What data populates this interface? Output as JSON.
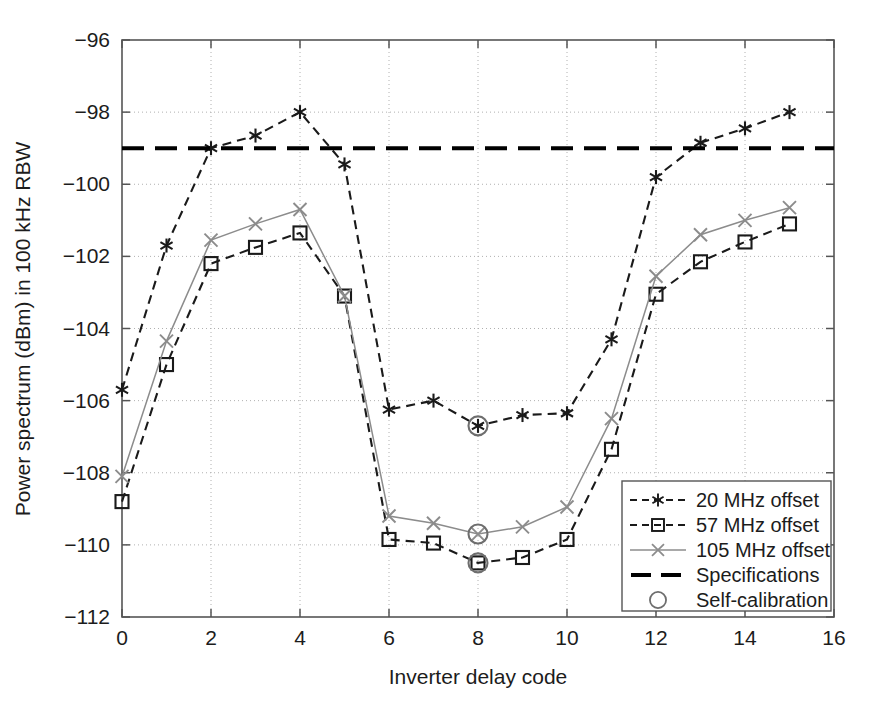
{
  "chart_data": {
    "type": "line",
    "title": "",
    "xlabel": "Inverter delay code",
    "ylabel": "Power spectrum (dBm) in 100 kHz RBW",
    "xlim": [
      0,
      16
    ],
    "ylim": [
      -112,
      -96
    ],
    "xticks": [
      0,
      2,
      4,
      6,
      8,
      10,
      12,
      14,
      16
    ],
    "yticks": [
      -112,
      -110,
      -108,
      -106,
      -104,
      -102,
      -100,
      -98,
      -96
    ],
    "xtick_labels": [
      "0",
      "2",
      "4",
      "6",
      "8",
      "10",
      "12",
      "14",
      "16"
    ],
    "ytick_labels": [
      "−112",
      "−110",
      "−108",
      "−106",
      "−104",
      "−102",
      "−100",
      "−98",
      "−96"
    ],
    "grid": true,
    "grid_style": "dotted",
    "legend_position": "lower right",
    "x": [
      0,
      1,
      2,
      3,
      4,
      5,
      6,
      7,
      8,
      9,
      10,
      11,
      12,
      13,
      14,
      15
    ],
    "series": [
      {
        "name": "20 MHz offset",
        "marker": "asterisk",
        "linestyle": "dashed",
        "color": "#1a1a1a",
        "values": [
          -105.7,
          -101.7,
          -99.0,
          -98.65,
          -98.0,
          -99.45,
          -106.25,
          -106.0,
          -106.7,
          -106.4,
          -106.35,
          -104.3,
          -99.8,
          -98.85,
          -98.45,
          -98.0
        ]
      },
      {
        "name": "57 MHz offset",
        "marker": "square",
        "linestyle": "dashed",
        "color": "#1a1a1a",
        "values": [
          -108.8,
          -105.0,
          -102.2,
          -101.75,
          -101.35,
          -103.1,
          -109.85,
          -109.95,
          -110.5,
          -110.35,
          -109.85,
          -107.35,
          -103.05,
          -102.15,
          -101.6,
          -101.1
        ]
      },
      {
        "name": "105 MHz offset",
        "marker": "cross",
        "linestyle": "solid",
        "color": "#8c8c8c",
        "values": [
          -108.1,
          -104.35,
          -101.55,
          -101.1,
          -100.7,
          -103.1,
          -109.2,
          -109.4,
          -109.7,
          -109.5,
          -108.95,
          -106.5,
          -102.55,
          -101.4,
          -101.0,
          -100.65
        ]
      }
    ],
    "reference_line": {
      "name": "Specifications",
      "value": -99.0,
      "linestyle": "dashed",
      "color": "#000000",
      "linewidth": 4
    },
    "annotations": {
      "name": "Self-calibration",
      "marker": "circle",
      "color": "#6e6e6e",
      "x": 8,
      "points": [
        {
          "series": "20 MHz offset",
          "x": 8,
          "y": -106.7
        },
        {
          "series": "57 MHz offset",
          "x": 8,
          "y": -110.5
        },
        {
          "series": "105 MHz offset",
          "x": 8,
          "y": -109.7
        }
      ]
    },
    "legend": [
      {
        "label": "20 MHz offset",
        "marker": "asterisk",
        "linestyle": "dashed",
        "color": "#1a1a1a"
      },
      {
        "label": "57 MHz offset",
        "marker": "square",
        "linestyle": "dashed",
        "color": "#1a1a1a"
      },
      {
        "label": "105 MHz offset",
        "marker": "cross",
        "linestyle": "solid",
        "color": "#8c8c8c"
      },
      {
        "label": "Specifications",
        "marker": "none",
        "linestyle": "thick-dashed",
        "color": "#000000"
      },
      {
        "label": "Self-calibration",
        "marker": "circle",
        "linestyle": "none",
        "color": "#6e6e6e"
      }
    ]
  },
  "axes": {
    "x_title": "Inverter delay code",
    "y_title": "Power spectrum (dBm) in 100 kHz RBW",
    "x_labels": [
      "0",
      "2",
      "4",
      "6",
      "8",
      "10",
      "12",
      "14",
      "16"
    ],
    "y_labels": [
      "−96",
      "−98",
      "−100",
      "−102",
      "−104",
      "−106",
      "−108",
      "−110",
      "−112"
    ]
  },
  "legend_box": {
    "items": [
      "20 MHz offset",
      "57 MHz offset",
      "105 MHz offset",
      "Specifications",
      "Self-calibration"
    ]
  },
  "colors": {
    "axis": "#555555",
    "grid": "#b0b0b0",
    "series_dark": "#1a1a1a",
    "series_gray": "#8c8c8c",
    "spec": "#000000",
    "selfcal": "#6e6e6e",
    "background": "#ffffff"
  }
}
